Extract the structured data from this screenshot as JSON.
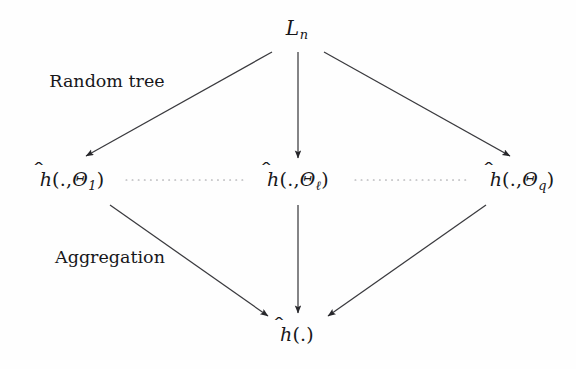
{
  "figure": {
    "type": "flow-diagram",
    "background_color": "#fefefe",
    "line_color": "#3a3a3e",
    "text_color": "#17171a",
    "width": 576,
    "height": 369
  },
  "nodes": {
    "root": {
      "id": "sample-set",
      "text": "ℒn",
      "symbol": "L",
      "subscript": "n",
      "x": 297,
      "y": 30
    },
    "tree_first": {
      "id": "tree-theta-1",
      "text": "h(.,Θ1)",
      "symbol": "h",
      "hat": true,
      "argument": ".",
      "parameter": "Θ",
      "subscript": "1",
      "x": 72,
      "y": 181
    },
    "tree_ell": {
      "id": "tree-theta-ell",
      "text": "h(.,Θℓ)",
      "symbol": "h",
      "hat": true,
      "argument": ".",
      "parameter": "Θ",
      "subscript": "ℓ",
      "x": 298,
      "y": 181
    },
    "tree_q": {
      "id": "tree-theta-q",
      "text": "h(.,Θq)",
      "symbol": "h",
      "hat": true,
      "argument": ".",
      "parameter": "Θ",
      "subscript": "q",
      "x": 522,
      "y": 181
    },
    "forest": {
      "id": "aggregated-estimate",
      "text": "h(.)",
      "symbol": "h",
      "hat": true,
      "argument": ".",
      "x": 297,
      "y": 334
    }
  },
  "stage_labels": [
    {
      "id": "random-tree",
      "label": "Random tree",
      "x": 107,
      "y": 82
    },
    {
      "id": "aggregation",
      "label": "Aggregation",
      "x": 110,
      "y": 258
    }
  ],
  "edges": [
    {
      "id": "root-to-tree-1",
      "from": "root",
      "to": "tree_first",
      "style": "solid",
      "arrow": true,
      "x1": 272,
      "y1": 52,
      "x2": 86,
      "y2": 156
    },
    {
      "id": "root-to-tree-ell",
      "from": "root",
      "to": "tree_ell",
      "style": "solid",
      "arrow": true,
      "x1": 298,
      "y1": 52,
      "x2": 298,
      "y2": 158
    },
    {
      "id": "root-to-tree-q",
      "from": "root",
      "to": "tree_q",
      "style": "solid",
      "arrow": true,
      "x1": 324,
      "y1": 52,
      "x2": 510,
      "y2": 156
    },
    {
      "id": "tree-1-to-forest",
      "from": "tree_first",
      "to": "forest",
      "style": "solid",
      "arrow": true,
      "x1": 110,
      "y1": 205,
      "x2": 268,
      "y2": 316
    },
    {
      "id": "tree-ell-to-forest",
      "from": "tree_ell",
      "to": "forest",
      "style": "solid",
      "arrow": true,
      "x1": 298,
      "y1": 205,
      "x2": 298,
      "y2": 313
    },
    {
      "id": "tree-q-to-forest",
      "from": "tree_q",
      "to": "forest",
      "style": "solid",
      "arrow": true,
      "x1": 486,
      "y1": 205,
      "x2": 328,
      "y2": 316
    },
    {
      "id": "ellipsis-left",
      "from": "tree_first",
      "to": "tree_ell",
      "style": "dotted",
      "arrow": false,
      "x1": 126,
      "y1": 180,
      "x2": 243,
      "y2": 180
    },
    {
      "id": "ellipsis-right",
      "from": "tree_ell",
      "to": "tree_q",
      "style": "dotted",
      "arrow": false,
      "x1": 355,
      "y1": 180,
      "x2": 470,
      "y2": 180
    }
  ]
}
